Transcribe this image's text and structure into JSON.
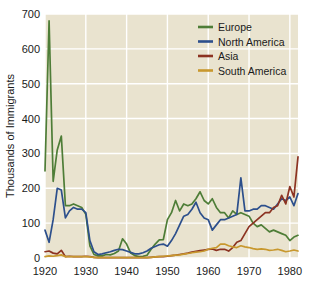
{
  "chart_data": {
    "type": "line",
    "title": "",
    "xlabel": "",
    "ylabel": "Thousands of Immigrants",
    "xlim": [
      1920,
      1982
    ],
    "ylim": [
      0,
      700
    ],
    "grid": true,
    "legend_position": "top-right",
    "x_ticks": [
      "1920",
      "1930",
      "1940",
      "1950",
      "1960",
      "1970",
      "1980"
    ],
    "x_tick_values": [
      1920,
      1930,
      1940,
      1950,
      1960,
      1970,
      1980
    ],
    "y_ticks": [
      "0",
      "100",
      "200",
      "300",
      "400",
      "500",
      "600",
      "700"
    ],
    "y_tick_values": [
      0,
      100,
      200,
      300,
      400,
      500,
      600,
      700
    ],
    "x": [
      1920,
      1921,
      1922,
      1923,
      1924,
      1925,
      1926,
      1927,
      1928,
      1929,
      1930,
      1931,
      1932,
      1933,
      1934,
      1935,
      1936,
      1937,
      1938,
      1939,
      1940,
      1941,
      1942,
      1943,
      1944,
      1945,
      1946,
      1947,
      1948,
      1949,
      1950,
      1951,
      1952,
      1953,
      1954,
      1955,
      1956,
      1957,
      1958,
      1959,
      1960,
      1961,
      1962,
      1963,
      1964,
      1965,
      1966,
      1967,
      1968,
      1969,
      1970,
      1971,
      1972,
      1973,
      1974,
      1975,
      1976,
      1977,
      1978,
      1979,
      1980,
      1981,
      1982
    ],
    "series": [
      {
        "name": "Europe",
        "color": "#4e7d37",
        "values": [
          250,
          680,
          220,
          310,
          350,
          150,
          150,
          155,
          150,
          145,
          125,
          35,
          10,
          6,
          6,
          10,
          9,
          13,
          20,
          55,
          40,
          14,
          7,
          4,
          5,
          8,
          25,
          40,
          52,
          53,
          110,
          130,
          165,
          135,
          155,
          150,
          155,
          170,
          190,
          165,
          155,
          170,
          145,
          130,
          130,
          115,
          135,
          125,
          130,
          125,
          120,
          100,
          90,
          95,
          85,
          75,
          80,
          75,
          70,
          65,
          50,
          60,
          65
        ],
        "peak_note": "1921 peak ~680"
      },
      {
        "name": "North America",
        "color": "#2c4f8c",
        "values": [
          80,
          45,
          110,
          200,
          195,
          115,
          135,
          145,
          140,
          140,
          130,
          50,
          18,
          10,
          12,
          15,
          18,
          22,
          25,
          24,
          20,
          16,
          12,
          12,
          15,
          20,
          28,
          33,
          38,
          40,
          34,
          50,
          70,
          95,
          120,
          125,
          140,
          160,
          130,
          115,
          110,
          80,
          95,
          110,
          110,
          115,
          120,
          125,
          230,
          135,
          135,
          140,
          140,
          150,
          150,
          145,
          140,
          155,
          170,
          165,
          175,
          150,
          185
        ],
        "peak_note": "1968 spike ~230"
      },
      {
        "name": "Asia",
        "color": "#8c3322",
        "values": [
          18,
          20,
          14,
          12,
          22,
          4,
          5,
          4,
          4,
          4,
          5,
          4,
          2,
          1,
          1,
          1,
          1,
          1,
          1,
          1,
          1,
          1,
          1,
          1,
          1,
          1,
          2,
          3,
          4,
          4,
          5,
          7,
          8,
          10,
          12,
          14,
          17,
          19,
          21,
          23,
          25,
          26,
          22,
          25,
          25,
          20,
          30,
          45,
          50,
          70,
          90,
          100,
          110,
          120,
          130,
          130,
          145,
          150,
          180,
          155,
          205,
          175,
          290
        ],
        "peak_note": "1982 high ~290"
      },
      {
        "name": "South America",
        "color": "#c8982e",
        "values": [
          4,
          6,
          5,
          7,
          9,
          4,
          4,
          4,
          4,
          4,
          4,
          3,
          2,
          1,
          1,
          1,
          1,
          1,
          1,
          1,
          1,
          1,
          1,
          1,
          1,
          1,
          2,
          3,
          4,
          5,
          6,
          7,
          8,
          9,
          11,
          13,
          15,
          17,
          18,
          20,
          25,
          28,
          30,
          40,
          40,
          35,
          32,
          30,
          35,
          32,
          30,
          27,
          25,
          26,
          25,
          22,
          23,
          25,
          22,
          18,
          20,
          23,
          20
        ],
        "peak_note": "1963-64 ~40"
      }
    ],
    "legend": [
      {
        "label": "Europe",
        "color": "#4e7d37"
      },
      {
        "label": "North America",
        "color": "#2c4f8c"
      },
      {
        "label": "Asia",
        "color": "#8c3322"
      },
      {
        "label": "South America",
        "color": "#c8982e"
      }
    ],
    "colors": {
      "plot_background": "#e9e3cf",
      "gridline": "#ffffff",
      "page_background": "#ffffff",
      "text": "#1a1a1a"
    }
  }
}
